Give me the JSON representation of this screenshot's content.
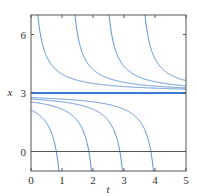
{
  "chart_data": {
    "type": "line",
    "title": "",
    "xlabel": "t",
    "ylabel": "x",
    "xlim": [
      0,
      5
    ],
    "ylim": [
      -1,
      7
    ],
    "xticks": [
      0,
      1,
      2,
      3,
      4,
      5
    ],
    "yticks": [
      0,
      3,
      6
    ],
    "grid": false,
    "legend": null,
    "reference_lines": [
      {
        "name": "equilibrium",
        "y": 3,
        "color": "#3a7bd5"
      },
      {
        "name": "zero-line",
        "y": 0,
        "color": "#555555"
      }
    ],
    "series": [
      {
        "name": "upper-c0.0",
        "c": -0.03,
        "branch": "upper"
      },
      {
        "name": "upper-c1.2",
        "c": 1.17,
        "branch": "upper"
      },
      {
        "name": "upper-c2.3",
        "c": 2.27,
        "branch": "upper"
      },
      {
        "name": "upper-c3.4",
        "c": 3.43,
        "branch": "upper"
      },
      {
        "name": "lower-c1.15",
        "c": 1.15,
        "branch": "lower"
      },
      {
        "name": "lower-c2.2",
        "c": 2.2,
        "branch": "lower"
      },
      {
        "name": "lower-c3.2",
        "c": 3.2,
        "branch": "lower"
      },
      {
        "name": "lower-c4.2",
        "c": 4.2,
        "branch": "lower"
      }
    ],
    "curve_color": "#5b8fd6",
    "frame_color": "#555555"
  }
}
